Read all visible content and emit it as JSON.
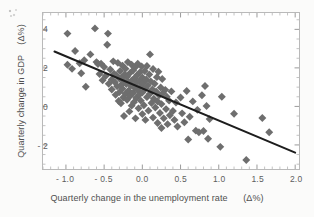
{
  "chart_data": {
    "type": "scatter",
    "title": "",
    "xlabel": "Quarterly change in the unemployment rate      (Δ%)",
    "ylabel": "Quarterly change in GDP    (Δ%)",
    "xlim": [
      -1.3,
      2.05
    ],
    "ylim": [
      -3.25,
      4.85
    ],
    "xticks": [
      -1.0,
      -0.5,
      0.0,
      0.5,
      1.0,
      1.5,
      2.0
    ],
    "xtick_labels": [
      "- 1.0",
      "- 0.5",
      "0.0",
      "0.5",
      "1.0",
      "1.5",
      "2.0"
    ],
    "yticks": [
      -2,
      0,
      2,
      4
    ],
    "ytick_labels": [
      "- 2",
      "0",
      "2",
      "4"
    ],
    "grid": false,
    "legend": null,
    "minor_ticks": true,
    "marker": "diamond",
    "marker_color": "#6e6e6e",
    "marker_size": 4,
    "trendline": {
      "type": "linear-fit",
      "color": "#1d1d1d",
      "width": 2,
      "slope": -1.67,
      "intercept": 0.93,
      "x_start": -1.15,
      "y_start": 2.85,
      "x_end": 2.0,
      "y_end": -2.4
    },
    "series": [
      {
        "name": "Quarterly observations",
        "points": [
          [
            -0.98,
            3.78
          ],
          [
            -0.98,
            2.16
          ],
          [
            -0.92,
            1.95
          ],
          [
            -0.88,
            2.88
          ],
          [
            -0.82,
            2.24
          ],
          [
            -0.8,
            1.72
          ],
          [
            -0.76,
            2.4
          ],
          [
            -0.74,
            1.02
          ],
          [
            -0.68,
            2.7
          ],
          [
            -0.62,
            4.05
          ],
          [
            -0.6,
            2.3
          ],
          [
            -0.58,
            2.2
          ],
          [
            -0.56,
            1.68
          ],
          [
            -0.54,
            2.22
          ],
          [
            -0.52,
            1.36
          ],
          [
            -0.5,
            2.05
          ],
          [
            -0.48,
            1.58
          ],
          [
            -0.46,
            3.2
          ],
          [
            -0.45,
            3.78
          ],
          [
            -0.44,
            1.18
          ],
          [
            -0.42,
            1.92
          ],
          [
            -0.4,
            1.4
          ],
          [
            -0.4,
            0.88
          ],
          [
            -0.38,
            2.34
          ],
          [
            -0.37,
            1.7
          ],
          [
            -0.36,
            1.26
          ],
          [
            -0.35,
            0.6
          ],
          [
            -0.34,
            1.62
          ],
          [
            -0.33,
            1.05
          ],
          [
            -0.32,
            2.26
          ],
          [
            -0.31,
            0.28
          ],
          [
            -0.3,
            1.44
          ],
          [
            -0.3,
            0.74
          ],
          [
            -0.29,
            1.84
          ],
          [
            -0.28,
            1.1
          ],
          [
            -0.28,
            0.16
          ],
          [
            -0.27,
            1.5
          ],
          [
            -0.26,
            0.92
          ],
          [
            -0.26,
            2.12
          ],
          [
            -0.25,
            0.46
          ],
          [
            -0.24,
            1.3
          ],
          [
            -0.24,
            -0.5
          ],
          [
            -0.23,
            1.66
          ],
          [
            -0.22,
            0.66
          ],
          [
            -0.22,
            1.96
          ],
          [
            -0.21,
            1.16
          ],
          [
            -0.2,
            0.34
          ],
          [
            -0.2,
            1.54
          ],
          [
            -0.19,
            2.3
          ],
          [
            -0.18,
            0.82
          ],
          [
            -0.18,
            1.24
          ],
          [
            -0.17,
            -0.26
          ],
          [
            -0.16,
            1.74
          ],
          [
            -0.16,
            0.54
          ],
          [
            -0.15,
            1.08
          ],
          [
            -0.14,
            2.16
          ],
          [
            -0.14,
            0.04
          ],
          [
            -0.13,
            1.38
          ],
          [
            -0.12,
            0.7
          ],
          [
            -0.12,
            1.88
          ],
          [
            -0.11,
            0.22
          ],
          [
            -0.1,
            1.46
          ],
          [
            -0.1,
            0.96
          ],
          [
            -0.09,
            2.04
          ],
          [
            -0.09,
            -0.62
          ],
          [
            -0.08,
            1.2
          ],
          [
            -0.08,
            0.44
          ],
          [
            -0.07,
            1.62
          ],
          [
            -0.06,
            0.84
          ],
          [
            -0.06,
            2.22
          ],
          [
            -0.05,
            -0.1
          ],
          [
            -0.04,
            1.32
          ],
          [
            -0.04,
            0.6
          ],
          [
            -0.03,
            1.78
          ],
          [
            -0.02,
            0.3
          ],
          [
            -0.02,
            1.04
          ],
          [
            -0.01,
            2.08
          ],
          [
            0.0,
            1.5
          ],
          [
            0.0,
            0.72
          ],
          [
            0.0,
            -0.4
          ],
          [
            0.01,
            1.22
          ],
          [
            0.02,
            0.06
          ],
          [
            0.03,
            1.84
          ],
          [
            0.04,
            0.92
          ],
          [
            0.04,
            -0.7
          ],
          [
            0.05,
            1.4
          ],
          [
            0.06,
            0.48
          ],
          [
            0.06,
            2.1
          ],
          [
            0.07,
            1.08
          ],
          [
            0.08,
            -0.22
          ],
          [
            0.09,
            1.66
          ],
          [
            0.1,
            0.66
          ],
          [
            0.1,
            2.7
          ],
          [
            0.11,
            1.3
          ],
          [
            0.12,
            0.18
          ],
          [
            0.13,
            0.88
          ],
          [
            0.14,
            1.94
          ],
          [
            0.14,
            -0.58
          ],
          [
            0.15,
            0.4
          ],
          [
            0.16,
            1.18
          ],
          [
            0.17,
            -0.06
          ],
          [
            0.18,
            0.78
          ],
          [
            0.19,
            1.52
          ],
          [
            0.2,
            0.26
          ],
          [
            0.2,
            -0.86
          ],
          [
            0.21,
            1.8
          ],
          [
            0.22,
            0.58
          ],
          [
            0.23,
            -0.34
          ],
          [
            0.24,
            0.98
          ],
          [
            0.25,
            0.12
          ],
          [
            0.25,
            -1.12
          ],
          [
            0.26,
            1.42
          ],
          [
            0.27,
            0.7
          ],
          [
            0.28,
            -0.62
          ],
          [
            0.3,
            0.86
          ],
          [
            0.31,
            -0.14
          ],
          [
            0.32,
            0.5
          ],
          [
            0.33,
            -0.92
          ],
          [
            0.35,
            0.3
          ],
          [
            0.36,
            -0.46
          ],
          [
            0.38,
            0.78
          ],
          [
            0.4,
            -0.24
          ],
          [
            0.42,
            -0.7
          ],
          [
            0.44,
            0.2
          ],
          [
            0.46,
            -1.04
          ],
          [
            0.5,
            0.46
          ],
          [
            0.52,
            -0.36
          ],
          [
            0.55,
            -0.82
          ],
          [
            0.58,
            0.8
          ],
          [
            0.6,
            -1.72
          ],
          [
            0.62,
            -0.54
          ],
          [
            0.66,
            0.26
          ],
          [
            0.7,
            -1.26
          ],
          [
            0.72,
            -0.18
          ],
          [
            0.74,
            -1.34
          ],
          [
            0.78,
            0.58
          ],
          [
            0.8,
            -1.28
          ],
          [
            0.82,
            1.06
          ],
          [
            0.84,
            0.02
          ],
          [
            0.86,
            -1.68
          ],
          [
            0.88,
            -0.66
          ],
          [
            1.02,
            -2.1
          ],
          [
            1.04,
            0.5
          ],
          [
            1.2,
            -0.38
          ],
          [
            1.36,
            -2.78
          ],
          [
            1.57,
            -0.6
          ],
          [
            1.66,
            -1.34
          ]
        ]
      }
    ]
  }
}
